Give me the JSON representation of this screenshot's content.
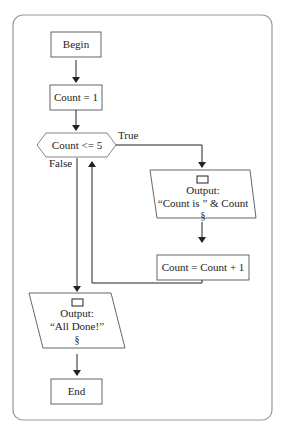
{
  "flowchart": {
    "begin": "Begin",
    "init": "Count = 1",
    "decision": "Count <= 5",
    "true_label": "True",
    "false_label": "False",
    "output1": {
      "line1": "Output:",
      "line2": "“Count is ” & Count",
      "line3": "§"
    },
    "increment": "Count = Count + 1",
    "output2": {
      "line1": "Output:",
      "line2": "“All Done!”",
      "line3": "§"
    },
    "end": "End"
  },
  "colors": {
    "stroke": "#333333",
    "frame": "#888888",
    "background": "#ffffff"
  }
}
